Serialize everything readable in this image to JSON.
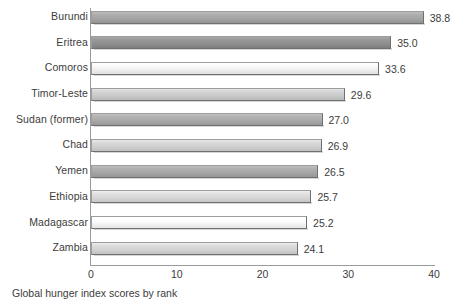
{
  "chart_data": {
    "type": "bar",
    "orientation": "horizontal",
    "title": "",
    "subtitle": "",
    "caption": "Global hunger index scores by rank",
    "xlabel": "",
    "ylabel": "",
    "xlim": [
      0,
      40
    ],
    "xticks": [
      0,
      10,
      20,
      30,
      40
    ],
    "xtick_labels": [
      "0",
      "10",
      "20",
      "30",
      "40"
    ],
    "grid": false,
    "legend": false,
    "categories": [
      "Burundi",
      "Eritrea",
      "Comoros",
      "Timor-Leste",
      "Sudan (former)",
      "Chad",
      "Yemen",
      "Ethiopia",
      "Madagascar",
      "Zambia"
    ],
    "values": [
      38.8,
      35.0,
      33.6,
      29.6,
      27.0,
      26.9,
      26.5,
      25.7,
      25.2,
      24.1
    ],
    "value_labels": [
      "38.8",
      "35.0",
      "33.6",
      "29.6",
      "27.0",
      "26.9",
      "26.5",
      "25.7",
      "25.2",
      "24.1"
    ],
    "bar_colors": [
      "#a3a3a3",
      "#8e8e8e",
      "#efefef",
      "#c9c9c9",
      "#a8a8a8",
      "#cfcfcf",
      "#a5a5a5",
      "#d6d6d6",
      "#f4f4f4",
      "#d2d2d2"
    ],
    "axis_color": "#9a9a9a",
    "text_color": "#3c3c3c",
    "background": "#ffffff"
  }
}
